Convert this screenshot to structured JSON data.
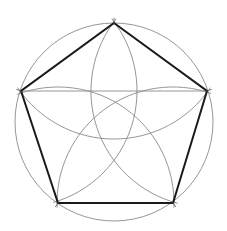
{
  "diagram": {
    "circle": {
      "cx": 114,
      "cy": 122,
      "r": 99,
      "stroke": "#8a8a8a"
    },
    "vertices": [
      {
        "id": "top",
        "x": 114,
        "y": 23
      },
      {
        "id": "right",
        "x": 207,
        "y": 91
      },
      {
        "id": "bottom-right",
        "x": 173,
        "y": 203
      },
      {
        "id": "bottom-left",
        "x": 58,
        "y": 203
      },
      {
        "id": "left",
        "x": 21,
        "y": 91
      }
    ],
    "pentagon_stroke": "#1a1a1a",
    "construction_stroke": "#8a8a8a",
    "arc_radius": 116,
    "chord": {
      "x1": 21,
      "y1": 91,
      "x2": 207,
      "y2": 91
    }
  }
}
